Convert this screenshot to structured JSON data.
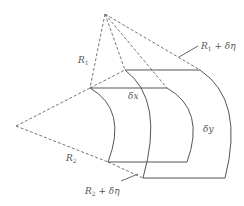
{
  "diagram": {
    "type": "geometry",
    "labels": {
      "r1": "R",
      "r1_sub": "1",
      "r1_plus": "R",
      "r1_plus_sub": "1",
      "r1_plus_tail": " + δη",
      "r2": "R",
      "r2_sub": "2",
      "r2_plus": "R",
      "r2_plus_sub": "2",
      "r2_plus_tail": " + δη",
      "dx": "δx",
      "dy": "δy"
    },
    "colors": {
      "line": "#555555",
      "dashed": "#666666",
      "background": "#ffffff"
    }
  }
}
